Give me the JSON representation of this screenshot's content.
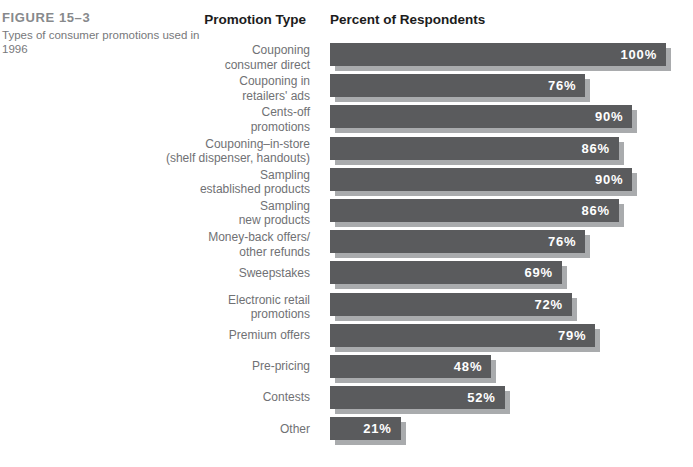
{
  "figure": {
    "label": "FIGURE 15–3",
    "caption": "Types of consumer promotions used in 1996"
  },
  "headers": {
    "promotion_type": "Promotion Type",
    "percent_of_respondents": "Percent of Respondents"
  },
  "colors": {
    "bar_fill": "#5a5b5d",
    "bar_shadow": "#a9abad",
    "value_text": "#ffffff",
    "label_text": "#707174",
    "header_text": "#1c1c1c",
    "figure_label_text": "#87898c"
  },
  "chart_data": {
    "type": "bar",
    "orientation": "horizontal",
    "title": "FIGURE 15–3  Types of consumer promotions used in 1996",
    "xlabel": "Percent of Respondents",
    "ylabel": "Promotion Type",
    "xlim": [
      0,
      100
    ],
    "grid": false,
    "legend": false,
    "value_suffix": "%",
    "categories": [
      "Couponing\nconsumer direct",
      "Couponing in\nretailers' ads",
      "Cents-off\npromotions",
      "Couponing–in-store\n(shelf dispenser, handouts)",
      "Sampling\nestablished products",
      "Sampling\nnew products",
      "Money-back offers/\nother refunds",
      "Sweepstakes",
      "Electronic retail\npromotions",
      "Premium offers",
      "Pre-pricing",
      "Contests",
      "Other"
    ],
    "values": [
      100,
      76,
      90,
      86,
      90,
      86,
      76,
      69,
      72,
      79,
      48,
      52,
      21
    ]
  }
}
